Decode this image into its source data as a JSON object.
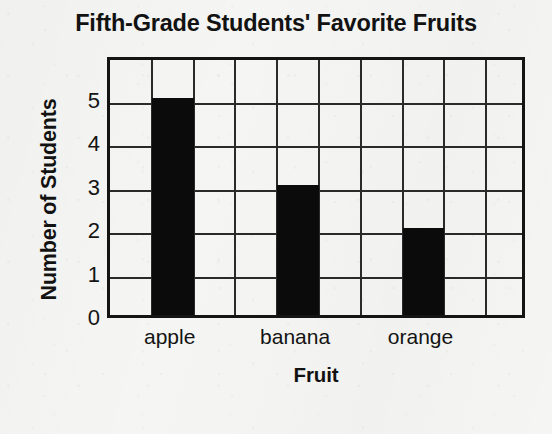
{
  "chart_data": {
    "type": "bar",
    "title": "Fifth-Grade Students' Favorite Fruits",
    "xlabel": "Fruit",
    "ylabel": "Number of Students",
    "categories": [
      "apple",
      "banana",
      "orange"
    ],
    "values": [
      5,
      3,
      2
    ],
    "ytick_labels": [
      "5",
      "4",
      "3",
      "2",
      "1",
      "0"
    ],
    "ytick_values": [
      5,
      4,
      3,
      2,
      1,
      0
    ],
    "ylim": [
      0,
      6
    ],
    "grid": true,
    "grid_columns": 10,
    "grid_rows": 6,
    "legend": "none",
    "bar_color": "#0b0b0b",
    "grid_color": "#2a2a2a",
    "axis_color": "#141414",
    "background_color": "#f5f5f3",
    "bar_grid_columns": [
      2,
      5,
      8
    ]
  }
}
